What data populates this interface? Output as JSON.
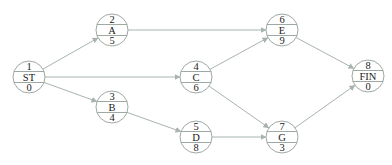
{
  "diagram": {
    "type": "activity-on-node network",
    "colors": {
      "line": "#a8b4ac",
      "node_outline": "#9fa9a3",
      "text": "#1a1a1a",
      "background": "#ffffff"
    },
    "nodes": [
      {
        "id": "ST",
        "top": "1",
        "label": "ST",
        "bottom": "0",
        "cx": 29,
        "cy": 77
      },
      {
        "id": "A",
        "top": "2",
        "label": "A",
        "bottom": "5",
        "cx": 112,
        "cy": 30
      },
      {
        "id": "B",
        "top": "3",
        "label": "B",
        "bottom": "4",
        "cx": 112,
        "cy": 107
      },
      {
        "id": "C",
        "top": "4",
        "label": "C",
        "bottom": "6",
        "cx": 196,
        "cy": 77
      },
      {
        "id": "D",
        "top": "5",
        "label": "D",
        "bottom": "8",
        "cx": 196,
        "cy": 137
      },
      {
        "id": "E",
        "top": "6",
        "label": "E",
        "bottom": "9",
        "cx": 282,
        "cy": 30
      },
      {
        "id": "G",
        "top": "7",
        "label": "G",
        "bottom": "3",
        "cx": 282,
        "cy": 137
      },
      {
        "id": "FIN",
        "top": "8",
        "label": "FIN",
        "bottom": "0",
        "cx": 368,
        "cy": 76
      }
    ],
    "edges": [
      {
        "from": "ST",
        "to": "A"
      },
      {
        "from": "ST",
        "to": "C"
      },
      {
        "from": "ST",
        "to": "B"
      },
      {
        "from": "A",
        "to": "E"
      },
      {
        "from": "C",
        "to": "E"
      },
      {
        "from": "C",
        "to": "G"
      },
      {
        "from": "B",
        "to": "D"
      },
      {
        "from": "D",
        "to": "G"
      },
      {
        "from": "E",
        "to": "FIN"
      },
      {
        "from": "G",
        "to": "FIN"
      }
    ]
  }
}
